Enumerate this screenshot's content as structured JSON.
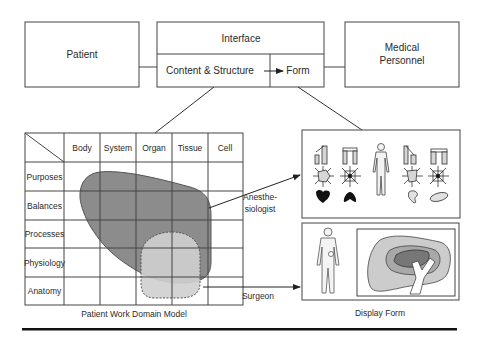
{
  "top": {
    "patient_label": "Patient",
    "interface_label": "Interface",
    "content_structure_label": "Content & Structure",
    "form_label": "Form",
    "medical_personnel_line1": "Medical",
    "medical_personnel_line2": "Personnel"
  },
  "grid": {
    "columns": [
      "Body",
      "System",
      "Organ",
      "Tissue",
      "Cell"
    ],
    "rows": [
      "Purposes",
      "Balances",
      "Processes",
      "Physiology",
      "Anatomy"
    ],
    "caption": "Patient Work Domain Model"
  },
  "arrows": {
    "anesthesiologist_line1": "Anesthe-",
    "anesthesiologist_line2": "siologist",
    "surgeon": "Surgeon"
  },
  "display": {
    "caption": "Display Form",
    "anesthesiologist_icons": [
      "bar-graph-icon",
      "sun-polygon-icon",
      "heart-icon",
      "bar-pair-icon",
      "star-web-icon",
      "lung-icon",
      "body-icon",
      "bar-step-icon",
      "sun-polygon-icon",
      "kidney-icon",
      "bar-pair-icon",
      "star-web-icon",
      "ellipse-icon"
    ],
    "surgeon_panels": [
      "body-outline-with-organ",
      "organ-cross-section"
    ]
  },
  "colors": {
    "dark_region": "#8c8c8c",
    "light_region": "#cfcfcf",
    "line": "#333333",
    "footer_rule": "#111111"
  }
}
